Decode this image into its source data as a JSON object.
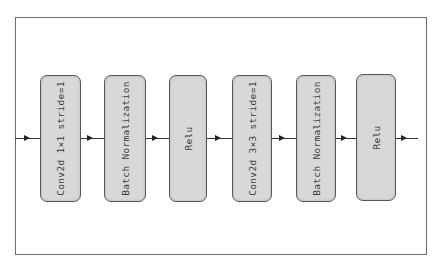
{
  "diagram": {
    "type": "residual-block-flow",
    "direction": "left-to-right",
    "blocks": [
      {
        "id": "b1",
        "label": "Conv2d 1×1 stride=1"
      },
      {
        "id": "b2",
        "label": "Batch Normalization"
      },
      {
        "id": "b3",
        "label": "Relu"
      },
      {
        "id": "b4",
        "label": "Conv2d 3×3 stride=1"
      },
      {
        "id": "b5",
        "label": "Batch Normalization"
      },
      {
        "id": "b6",
        "label": "Relu"
      }
    ],
    "edges": [
      {
        "from": "input",
        "to": "b1"
      },
      {
        "from": "b1",
        "to": "b2"
      },
      {
        "from": "b2",
        "to": "b3"
      },
      {
        "from": "b3",
        "to": "b4"
      },
      {
        "from": "b4",
        "to": "b5"
      },
      {
        "from": "b5",
        "to": "b6"
      },
      {
        "from": "b6",
        "to": "output"
      }
    ],
    "colors": {
      "block_fill": "#d8d8d8",
      "block_border": "#555555",
      "frame_border": "#6e6e6e",
      "arrow": "#222222"
    }
  }
}
